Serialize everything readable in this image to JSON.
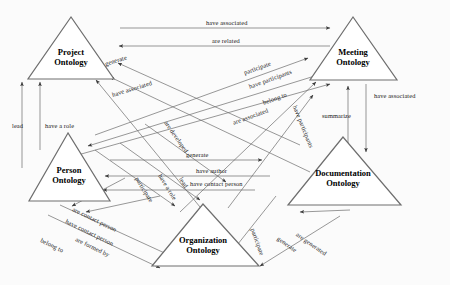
{
  "diagram": {
    "colors": {
      "background": "#fbfbfb",
      "node_stroke": "#6e6e6e",
      "node_fill": "#ffffff",
      "edge_stroke": "#6b6b6b",
      "text": "#000000"
    },
    "nodes": [
      {
        "id": "project",
        "line1": "Project",
        "line2": "Ontology",
        "apex": [
          71,
          17
        ],
        "left": [
          28,
          79
        ],
        "right": [
          114,
          79
        ]
      },
      {
        "id": "meeting",
        "line1": "Meeting",
        "line2": "Ontology",
        "apex": [
          353,
          17
        ],
        "left": [
          310,
          80
        ],
        "right": [
          397,
          80
        ]
      },
      {
        "id": "person",
        "line1": "Person",
        "line2": "Ontology",
        "apex": [
          68,
          133
        ],
        "left": [
          29,
          201
        ],
        "right": [
          110,
          201
        ]
      },
      {
        "id": "documentation",
        "line1": "Documentation",
        "line2": "Ontology",
        "apex": [
          343,
          137
        ],
        "left": [
          288,
          205
        ],
        "right": [
          401,
          205
        ]
      },
      {
        "id": "organization",
        "line1": "Organization",
        "line2": "Ontology",
        "apex": [
          203,
          204
        ],
        "left": [
          152,
          266
        ],
        "right": [
          259,
          266
        ]
      }
    ],
    "edges": [
      {
        "id": "e1",
        "label": "have associated",
        "from": "project",
        "to": "meeting",
        "lx": 206,
        "ly": 24,
        "rot": 0
      },
      {
        "id": "e2",
        "label": "are related",
        "from": "meeting",
        "to": "project",
        "lx": 212,
        "ly": 42,
        "rot": 0
      },
      {
        "id": "e3",
        "label": "generate",
        "from": "project",
        "to": "documentation",
        "lx": 105,
        "ly": 64,
        "rot": -17
      },
      {
        "id": "e4",
        "label": "have associated",
        "from": "project",
        "to": "documentation",
        "lx": 112,
        "ly": 95,
        "rot": -17
      },
      {
        "id": "e5",
        "label": "are developed",
        "from": "project",
        "to": "organization",
        "lx": 166,
        "ly": 122,
        "rot": 55
      },
      {
        "id": "e6",
        "label": "participate",
        "from": "person",
        "to": "meeting",
        "lx": 244,
        "ly": 73,
        "rot": -20
      },
      {
        "id": "e7",
        "label": "have participants",
        "from": "meeting",
        "to": "person",
        "lx": 249,
        "ly": 87,
        "rot": -20
      },
      {
        "id": "e8",
        "label": "belong to",
        "from": "organization",
        "to": "meeting",
        "lx": 263,
        "ly": 103,
        "rot": -20
      },
      {
        "id": "e9",
        "label": "are associated",
        "from": "documentation",
        "to": "meeting",
        "lx": 233,
        "ly": 123,
        "rot": -20
      },
      {
        "id": "e10",
        "label": "have participants",
        "from": "meeting",
        "to": "organization",
        "lx": 295,
        "ly": 106,
        "rot": 68
      },
      {
        "id": "e11",
        "label": "summarize",
        "from": "meeting",
        "to": "documentation",
        "lx": 322,
        "ly": 116,
        "rot": 0
      },
      {
        "id": "e12",
        "label": "have associated",
        "from": "documentation",
        "to": "meeting",
        "lx": 374,
        "ly": 96,
        "rot": 0
      },
      {
        "id": "e13",
        "label": "lead",
        "from": "person",
        "to": "project",
        "lx": 14,
        "ly": 126,
        "rot": 0
      },
      {
        "id": "e14",
        "label": "have a role",
        "from": "person",
        "to": "project",
        "lx": 45,
        "ly": 126,
        "rot": 0
      },
      {
        "id": "e15",
        "label": "generate",
        "from": "person",
        "to": "documentation",
        "lx": 191,
        "ly": 155,
        "rot": 0
      },
      {
        "id": "e16",
        "label": "have author",
        "from": "documentation",
        "to": "person",
        "lx": 200,
        "ly": 171,
        "rot": 0
      },
      {
        "id": "e17",
        "label": "have contact person",
        "from": "documentation",
        "to": "person",
        "lx": 196,
        "ly": 184,
        "rot": 0
      },
      {
        "id": "e18",
        "label": "participate",
        "from": "person",
        "to": "organization",
        "lx": 137,
        "ly": 178,
        "rot": 58
      },
      {
        "id": "e19",
        "label": "have a role",
        "from": "organization",
        "to": "person",
        "lx": 160,
        "ly": 175,
        "rot": 58
      },
      {
        "id": "e20",
        "label": "lead",
        "from": "organization",
        "to": "person",
        "lx": 181,
        "ly": 178,
        "rot": 58
      },
      {
        "id": "e21",
        "label": "are contact person",
        "from": "person",
        "to": "organization",
        "lx": 75,
        "ly": 209,
        "rot": 26
      },
      {
        "id": "e22",
        "label": "have contact person",
        "from": "organization",
        "to": "person",
        "lx": 68,
        "ly": 221,
        "rot": 26
      },
      {
        "id": "e23",
        "label": "are formed by",
        "from": "person",
        "to": "organization",
        "lx": 78,
        "ly": 239,
        "rot": 26
      },
      {
        "id": "e24",
        "label": "belong to",
        "from": "organization",
        "to": "person",
        "lx": 43,
        "ly": 240,
        "rot": 26
      },
      {
        "id": "e25",
        "label": "participate",
        "from": "organization",
        "to": "documentation",
        "lx": 253,
        "ly": 229,
        "rot": 70
      },
      {
        "id": "e26",
        "label": "generate",
        "from": "organization",
        "to": "documentation",
        "lx": 281,
        "ly": 238,
        "rot": 35
      },
      {
        "id": "e27",
        "label": "are generated",
        "from": "documentation",
        "to": "organization",
        "lx": 300,
        "ly": 234,
        "rot": 35
      }
    ]
  }
}
